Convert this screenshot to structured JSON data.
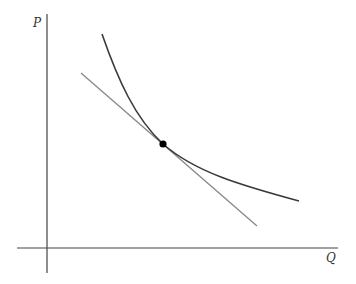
{
  "diagram": {
    "type": "economics-tangency",
    "axes": {
      "y_label": "P",
      "x_label": "Q"
    },
    "curve": {
      "description": "downward-sloping convex curve",
      "color": "#3a3a3a"
    },
    "tangent_line": {
      "description": "straight line tangent to curve",
      "color": "#8a8a8a"
    },
    "tangency_point": {
      "color": "#000000"
    }
  }
}
